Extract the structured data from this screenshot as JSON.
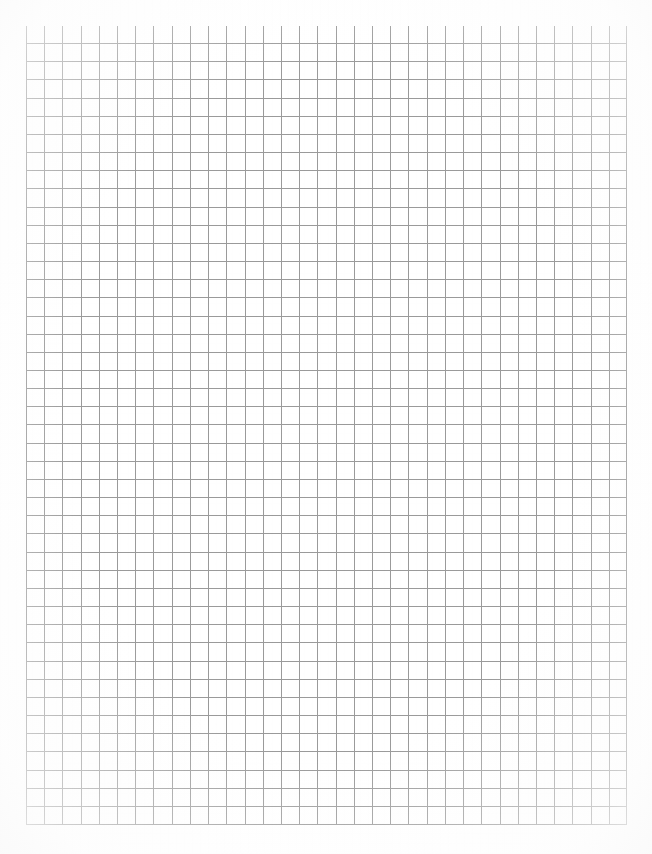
{
  "page": {
    "width": 652,
    "height": 854,
    "background_color": "#ffffff"
  },
  "grid": {
    "name": "quad-ruled-grid",
    "origin_x": 26,
    "origin_y": 26,
    "width": 601,
    "height": 799,
    "columns": 33,
    "rows": 44,
    "cell_size_px": 18.2,
    "line_color": "#9a9a9a",
    "line_color_soft": "#b8b8b8",
    "line_width_px": 1,
    "major_lines": false,
    "margin_color": "#ffffff"
  },
  "margins": {
    "left_px": 26,
    "top_px": 26,
    "right_px": 25,
    "bottom_px": 29
  },
  "annotations": {
    "text_present": false,
    "marks_present": false
  }
}
